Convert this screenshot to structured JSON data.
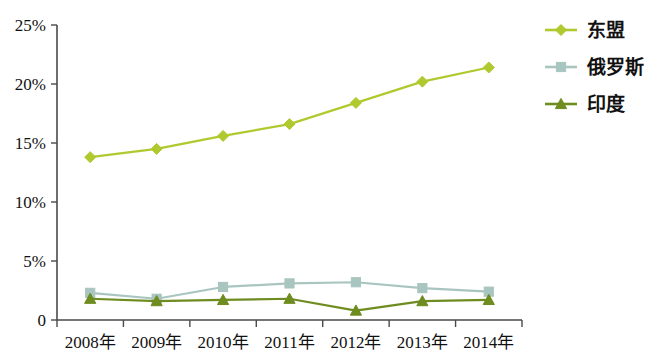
{
  "chart_data": {
    "type": "line",
    "title": "",
    "xlabel": "",
    "ylabel": "",
    "categories": [
      "2008年",
      "2009年",
      "2010年",
      "2011年",
      "2012年",
      "2013年",
      "2014年"
    ],
    "ylim": [
      0,
      25
    ],
    "yticks": [
      0,
      5,
      10,
      15,
      20,
      25
    ],
    "ytick_labels": [
      "0",
      "5%",
      "10%",
      "15%",
      "20%",
      "25%"
    ],
    "grid": false,
    "legend_position": "right-top",
    "series": [
      {
        "name": "东盟",
        "color": "#AFC92E",
        "marker": "diamond",
        "values": [
          13.8,
          14.5,
          15.6,
          16.6,
          18.4,
          20.2,
          21.4
        ]
      },
      {
        "name": "俄罗斯",
        "color": "#A9C5BF",
        "marker": "square",
        "values": [
          2.3,
          1.8,
          2.8,
          3.1,
          3.2,
          2.7,
          2.4
        ]
      },
      {
        "name": "印度",
        "color": "#6E8C1F",
        "marker": "triangle",
        "values": [
          1.8,
          1.6,
          1.7,
          1.8,
          0.8,
          1.6,
          1.7
        ]
      }
    ]
  },
  "axis": {
    "y_tick_labels": [
      "25%",
      "20%",
      "15%",
      "10%",
      "5%",
      "0"
    ],
    "x_tick_labels": [
      "2008年",
      "2009年",
      "2010年",
      "2011年",
      "2012年",
      "2013年",
      "2014年"
    ]
  },
  "legend": {
    "items": [
      {
        "label": "东盟",
        "color": "#AFC92E",
        "marker": "diamond"
      },
      {
        "label": "俄罗斯",
        "color": "#A9C5BF",
        "marker": "square"
      },
      {
        "label": "印度",
        "color": "#6E8C1F",
        "marker": "triangle"
      }
    ]
  },
  "colors": {
    "asean": "#AFC92E",
    "russia": "#A9C5BF",
    "india": "#6E8C1F",
    "axis": "#4a4a4a",
    "background": "#ffffff"
  }
}
